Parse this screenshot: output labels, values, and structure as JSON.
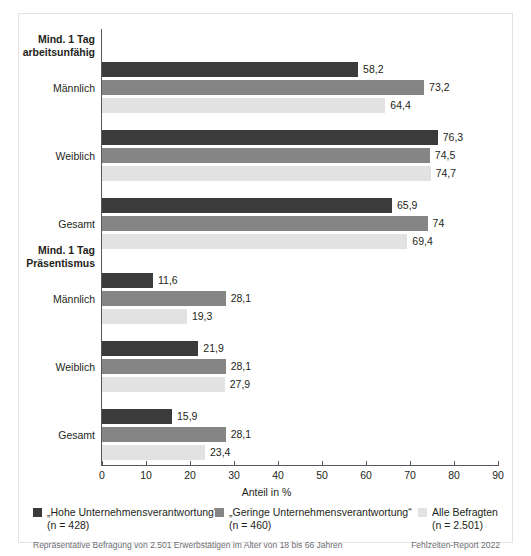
{
  "chart_data": {
    "type": "bar",
    "orientation": "horizontal",
    "xlabel": "Anteil in %",
    "ylabel": "",
    "title": "",
    "xlim": [
      0,
      90
    ],
    "xticks": [
      "0",
      "10",
      "20",
      "30",
      "40",
      "50",
      "60",
      "70",
      "80",
      "90"
    ],
    "grid": false,
    "legend_position": "bottom",
    "series": [
      {
        "name": "„Hohe Unternehmensverantwortung“",
        "n": "(n = 428)",
        "color": "#3b3b3b",
        "values": [
          58.2,
          76.3,
          65.9,
          11.6,
          21.9,
          15.9
        ],
        "labels": [
          "58,2",
          "76,3",
          "65,9",
          "11,6",
          "21,9",
          "15,9"
        ]
      },
      {
        "name": "„Geringe Unternehmensverantwortung“",
        "n": "(n = 460)",
        "color": "#858585",
        "values": [
          73.2,
          74.5,
          74,
          28.1,
          28.1,
          28.1
        ],
        "labels": [
          "73,2",
          "74,5",
          "74",
          "28,1",
          "28,1",
          "28,1"
        ]
      },
      {
        "name": "Alle Befragten",
        "n": "(n = 2.501)",
        "color": "#e2e2e2",
        "values": [
          64.4,
          74.7,
          69.4,
          19.3,
          27.9,
          23.4
        ],
        "labels": [
          "64,4",
          "74,7",
          "69,4",
          "19,3",
          "27,9",
          "23,4"
        ]
      }
    ],
    "groups": [
      {
        "heading": "Mind. 1 Tag arbeitsunfähig",
        "heading_line1": "Mind. 1 Tag",
        "heading_line2": "arbeitsunfähig",
        "categories": [
          "Männlich",
          "Weiblich",
          "Gesamt"
        ]
      },
      {
        "heading": "Mind. 1 Tag Präsentismus",
        "heading_line1": "Mind. 1 Tag",
        "heading_line2": "Präsentismus",
        "categories": [
          "Männlich",
          "Weiblich",
          "Gesamt"
        ]
      }
    ],
    "categories": [
      "Männlich",
      "Weiblich",
      "Gesamt",
      "Männlich",
      "Weiblich",
      "Gesamt"
    ]
  },
  "footer": {
    "note": "Repräsentative Befragung von 2.501 Erwerbstätigen im Alter von 18 bis 66 Jahren",
    "source": "Fehlzeiten-Report 2022"
  }
}
